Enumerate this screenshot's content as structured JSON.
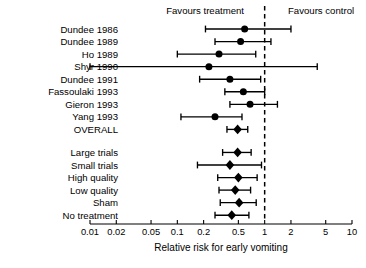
{
  "figure": {
    "header_left": "Favours treatment",
    "header_right": "Favours control",
    "axis_title": "Relative risk for early vomiting",
    "caption": "Effect of acupuncture on early vomiting compared with placebo"
  },
  "chart_data": {
    "type": "scatter",
    "subtype": "forest-plot",
    "title": "Relative risk for early vomiting",
    "xlabel": "Relative risk for early vomiting",
    "ylabel": "",
    "xscale": "log",
    "xlim": [
      0.01,
      10
    ],
    "grid": false,
    "null_value": 1,
    "legend_position": "top",
    "annotations": [
      {
        "text": "Favours treatment",
        "side": "left-of-null"
      },
      {
        "text": "Favours control",
        "side": "right-of-null"
      }
    ],
    "xticks": [
      0.01,
      0.02,
      0.05,
      0.1,
      0.2,
      0.5,
      1,
      2,
      5,
      10
    ],
    "xtick_labels": [
      "0.01",
      "0.02",
      "0.05",
      "0.1",
      "0.2",
      "0.5",
      "1",
      "2",
      "5",
      "10"
    ],
    "categories": [
      "Dundee 1986",
      "Dundee 1989",
      "Ho 1989",
      "Shyr 1990",
      "Dundee 1991",
      "Fassoulaki 1993",
      "Gieron 1993",
      "Yang 1993",
      "OVERALL",
      "Large trials",
      "Small trials",
      "High quality",
      "Low quality",
      "Sham",
      "No treatment"
    ],
    "series": [
      {
        "name": "Relative risk (95% CI)",
        "points": [
          {
            "label": "Dundee 1986",
            "group": "study",
            "marker": "circle",
            "value": 0.59,
            "ci_low": 0.21,
            "ci_high": 2.0
          },
          {
            "label": "Dundee 1989",
            "group": "study",
            "marker": "circle",
            "value": 0.53,
            "ci_low": 0.27,
            "ci_high": 1.18
          },
          {
            "label": "Ho 1989",
            "group": "study",
            "marker": "circle",
            "value": 0.3,
            "ci_low": 0.1,
            "ci_high": 0.79
          },
          {
            "label": "Shyr 1990",
            "group": "study",
            "marker": "circle",
            "value": 0.23,
            "ci_low": 0.01,
            "ci_high": 4.0
          },
          {
            "label": "Dundee 1991",
            "group": "study",
            "marker": "circle",
            "value": 0.4,
            "ci_low": 0.18,
            "ci_high": 0.9
          },
          {
            "label": "Fassoulaki 1993",
            "group": "study",
            "marker": "circle",
            "value": 0.57,
            "ci_low": 0.35,
            "ci_high": 1.0
          },
          {
            "label": "Gieron 1993",
            "group": "study",
            "marker": "circle",
            "value": 0.68,
            "ci_low": 0.4,
            "ci_high": 1.4
          },
          {
            "label": "Yang 1993",
            "group": "study",
            "marker": "circle",
            "value": 0.27,
            "ci_low": 0.11,
            "ci_high": 0.55
          },
          {
            "label": "OVERALL",
            "group": "overall",
            "marker": "diamond",
            "value": 0.49,
            "ci_low": 0.37,
            "ci_high": 0.64
          },
          {
            "label": "Large trials",
            "group": "subgroup",
            "marker": "diamond",
            "value": 0.49,
            "ci_low": 0.33,
            "ci_high": 0.7
          },
          {
            "label": "Small trials",
            "group": "subgroup",
            "marker": "diamond",
            "value": 0.4,
            "ci_low": 0.17,
            "ci_high": 0.92
          },
          {
            "label": "High quality",
            "group": "subgroup",
            "marker": "diamond",
            "value": 0.5,
            "ci_low": 0.29,
            "ci_high": 0.82
          },
          {
            "label": "Low quality",
            "group": "subgroup",
            "marker": "diamond",
            "value": 0.46,
            "ci_low": 0.3,
            "ci_high": 0.69
          },
          {
            "label": "Sham",
            "group": "subgroup",
            "marker": "diamond",
            "value": 0.51,
            "ci_low": 0.31,
            "ci_high": 0.8
          },
          {
            "label": "No treatment",
            "group": "subgroup",
            "marker": "diamond",
            "value": 0.42,
            "ci_low": 0.27,
            "ci_high": 0.66
          }
        ]
      }
    ]
  }
}
